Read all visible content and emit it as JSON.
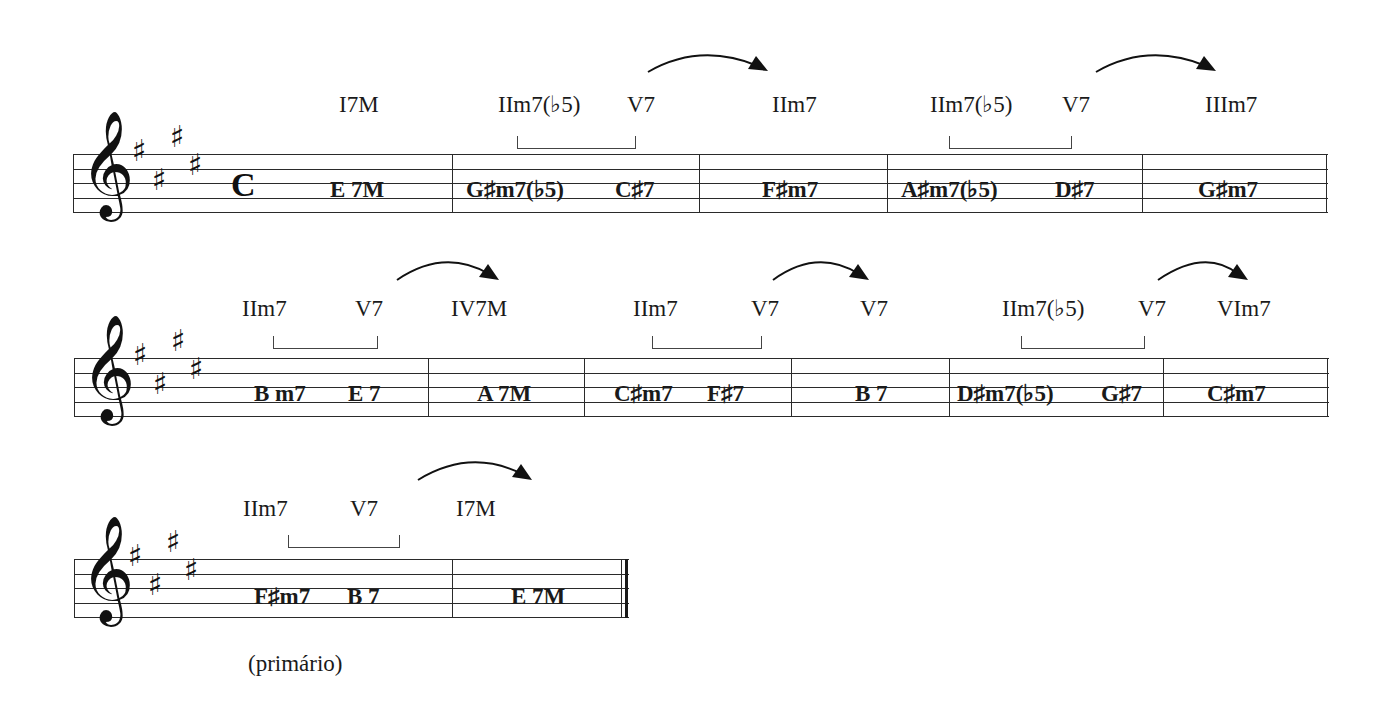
{
  "key_signature": {
    "clef": "treble",
    "sharps": [
      "F#",
      "C#",
      "G#",
      "D#"
    ],
    "key": "E major"
  },
  "time_signature": "C",
  "clef_glyph": "𝄞",
  "sharp_glyph": "♯",
  "systems": [
    {
      "romans": [
        "I7M",
        "IIm7(♭5)",
        "V7",
        "IIm7",
        "IIm7(♭5)",
        "V7",
        "IIIm7"
      ],
      "chords": [
        "E 7M",
        "G♯m7(♭5)",
        "C♯7",
        "F♯m7",
        "A♯m7(♭5)",
        "D♯7",
        "G♯m7"
      ]
    },
    {
      "romans": [
        "IIm7",
        "V7",
        "IV7M",
        "IIm7",
        "V7",
        "V7",
        "IIm7(♭5)",
        "V7",
        "VIm7"
      ],
      "chords": [
        "B m7",
        "E 7",
        "A 7M",
        "C♯m7",
        "F♯7",
        "B 7",
        "D♯m7(♭5)",
        "G♯7",
        "C♯m7"
      ]
    },
    {
      "romans": [
        "IIm7",
        "V7",
        "I7M"
      ],
      "chords": [
        "F♯m7",
        "B 7",
        "E 7M"
      ],
      "caption": "(primário)"
    }
  ]
}
